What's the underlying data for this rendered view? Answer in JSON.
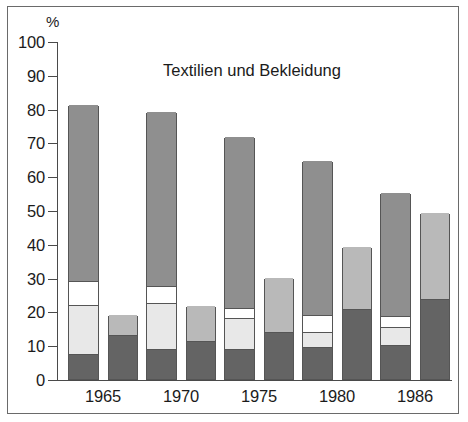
{
  "chart_data": {
    "type": "bar",
    "title": "Textilien und Bekleidung",
    "xlabel": "",
    "ylabel": "%",
    "ylim": [
      0,
      100
    ],
    "yticks": [
      0,
      10,
      20,
      30,
      40,
      50,
      60,
      70,
      80,
      90,
      100
    ],
    "grid": false,
    "legend": "none",
    "stacked": true,
    "categories": [
      "1965",
      "1970",
      "1975",
      "1980",
      "1986"
    ],
    "bars_per_category": 2,
    "series": [
      {
        "name": "bar-1-segment-1",
        "bar": 1,
        "color": "#646464",
        "values": [
          7.5,
          9.0,
          9.0,
          9.5,
          10.0
        ]
      },
      {
        "name": "bar-1-segment-2",
        "bar": 1,
        "color": "#e8e8e8",
        "values": [
          14.5,
          13.5,
          9.0,
          4.5,
          5.5
        ]
      },
      {
        "name": "bar-1-segment-3",
        "bar": 1,
        "color": "#ffffff",
        "values": [
          7.0,
          5.0,
          3.0,
          5.0,
          3.0
        ]
      },
      {
        "name": "bar-1-segment-4",
        "bar": 1,
        "color": "#8f8f8f",
        "values": [
          52.0,
          51.5,
          50.5,
          45.5,
          36.5
        ]
      },
      {
        "name": "bar-2-segment-1",
        "bar": 2,
        "color": "#646464",
        "values": [
          13.0,
          11.3,
          14.0,
          20.8,
          23.7
        ]
      },
      {
        "name": "bar-2-segment-2",
        "bar": 2,
        "color": "#b9b9b9",
        "values": [
          6.0,
          10.2,
          16.0,
          18.2,
          25.3
        ]
      }
    ],
    "bar_totals": {
      "bar_1": [
        81.0,
        79.0,
        71.5,
        64.5,
        55.0
      ],
      "bar_2": [
        19.0,
        21.5,
        30.0,
        39.0,
        49.0
      ]
    },
    "tick_labels": [
      "100",
      "90",
      "80",
      "70",
      "60",
      "50",
      "40",
      "30",
      "20",
      "10",
      "0"
    ]
  }
}
